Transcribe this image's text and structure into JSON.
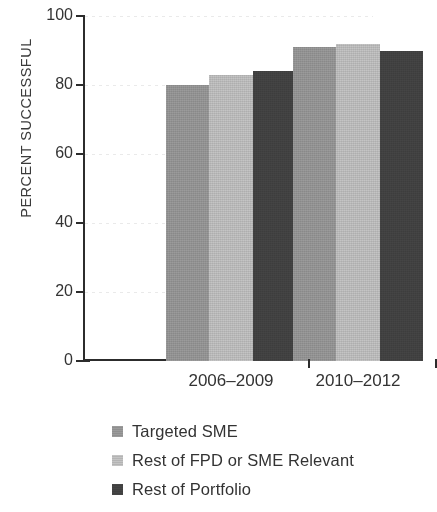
{
  "chart_data": {
    "type": "bar",
    "title": "",
    "subtitle": "",
    "xlabel": "",
    "ylabel": "PERCENT SUCCESSFUL",
    "ylim": [
      0,
      100
    ],
    "yticks": [
      0,
      20,
      40,
      60,
      80,
      100
    ],
    "ytick_labels": [
      "0",
      "20",
      "40",
      "60",
      "80",
      "100"
    ],
    "grid": true,
    "grid_style": "dotted-horizontal",
    "legend_position": "bottom-left",
    "categories": [
      "2006–2009",
      "2010–2012"
    ],
    "series": [
      {
        "name": "Targeted SME",
        "color": "#9b9b9b",
        "values": [
          80,
          91
        ]
      },
      {
        "name": "Rest of FPD or SME Relevant",
        "color": "#c4c4c4",
        "values": [
          83,
          92
        ]
      },
      {
        "name": "Rest of Portfolio",
        "color": "#454545",
        "values": [
          84,
          90
        ]
      }
    ]
  },
  "axis": {
    "y_label": "PERCENT SUCCESSFUL",
    "ticks": [
      {
        "label": "100",
        "value": 100
      },
      {
        "label": "80",
        "value": 80
      },
      {
        "label": "60",
        "value": 60
      },
      {
        "label": "40",
        "value": 40
      },
      {
        "label": "20",
        "value": 20
      },
      {
        "label": "0",
        "value": 0
      }
    ]
  },
  "legend": {
    "items": [
      {
        "label": "Targeted SME",
        "color": "#9b9b9b"
      },
      {
        "label": "Rest of FPD or SME Relevant",
        "color": "#c4c4c4"
      },
      {
        "label": "Rest of Portfolio",
        "color": "#454545"
      }
    ]
  }
}
